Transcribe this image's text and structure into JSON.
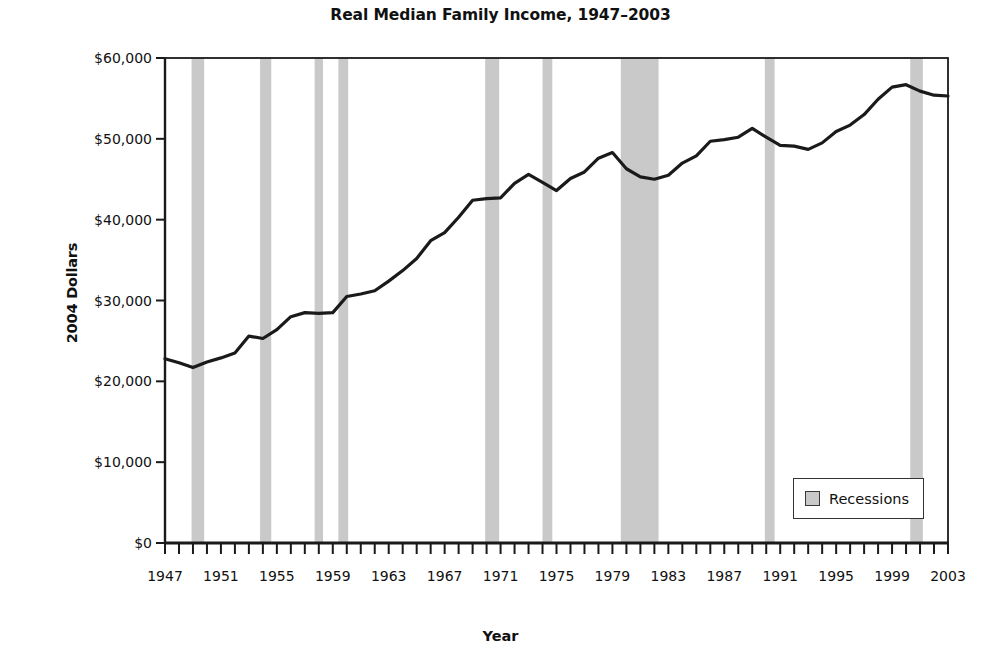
{
  "chart_data": {
    "type": "line",
    "title": "Real Median Family Income, 1947–2003",
    "xlabel": "Year",
    "ylabel": "2004 Dollars",
    "xlim": [
      1947,
      2003
    ],
    "ylim": [
      0,
      60000
    ],
    "grid": false,
    "legend": {
      "position": "bottom-right",
      "entries": [
        {
          "label": "Recessions",
          "swatch_color": "#c9c9c9",
          "type": "band"
        }
      ]
    },
    "ytick_values": [
      0,
      10000,
      20000,
      30000,
      40000,
      50000,
      60000
    ],
    "ytick_labels": [
      "$0",
      "$10,000",
      "$20,000",
      "$30,000",
      "$40,000",
      "$50,000",
      "$60,000"
    ],
    "xtick_values": [
      1947,
      1951,
      1955,
      1959,
      1963,
      1967,
      1971,
      1975,
      1979,
      1983,
      1987,
      1991,
      1995,
      1999,
      2003
    ],
    "xtick_labels": [
      "1947",
      "1951",
      "1955",
      "1959",
      "1963",
      "1967",
      "1971",
      "1975",
      "1979",
      "1983",
      "1987",
      "1991",
      "1995",
      "1999",
      "2003"
    ],
    "minor_xticks_every": 1,
    "series": [
      {
        "name": "Real Median Family Income",
        "color": "#1a1a1a",
        "line_width": 3.2,
        "x": [
          1947,
          1948,
          1949,
          1950,
          1951,
          1952,
          1953,
          1954,
          1955,
          1956,
          1957,
          1958,
          1959,
          1960,
          1961,
          1962,
          1963,
          1964,
          1965,
          1966,
          1967,
          1968,
          1969,
          1970,
          1971,
          1972,
          1973,
          1974,
          1975,
          1976,
          1977,
          1978,
          1979,
          1980,
          1981,
          1982,
          1983,
          1984,
          1985,
          1986,
          1987,
          1988,
          1989,
          1990,
          1991,
          1992,
          1993,
          1994,
          1995,
          1996,
          1997,
          1998,
          1999,
          2000,
          2001,
          2002,
          2003
        ],
        "y": [
          22800,
          22300,
          21700,
          22400,
          22900,
          23500,
          25600,
          25300,
          26400,
          28000,
          28500,
          28400,
          28500,
          30500,
          30800,
          31200,
          32400,
          33700,
          35200,
          37400,
          38400,
          40300,
          42400,
          42600,
          42700,
          44500,
          45600,
          44600,
          43600,
          45100,
          45900,
          47600,
          48300,
          46300,
          45300,
          45000,
          45500,
          47000,
          47900,
          49700,
          49900,
          50200,
          51300,
          50200,
          49200,
          49100,
          48700,
          49500,
          50900,
          51700,
          53000,
          54900,
          56400,
          56700,
          55900,
          55400,
          55300
        ]
      }
    ],
    "recession_bands": [
      {
        "start": 1948.9,
        "end": 1949.8,
        "label": "1948–49 recession"
      },
      {
        "start": 1953.8,
        "end": 1954.6,
        "label": "1953–54 recession"
      },
      {
        "start": 1957.7,
        "end": 1958.3,
        "label": "1957–58 recession"
      },
      {
        "start": 1959.4,
        "end": 1960.1,
        "label": "1960–61 recession"
      },
      {
        "start": 1969.9,
        "end": 1970.9,
        "label": "1969–70 recession"
      },
      {
        "start": 1974.0,
        "end": 1974.7,
        "label": "1973–75 recession"
      },
      {
        "start": 1979.6,
        "end": 1982.3,
        "label": "1980–82 recessions"
      },
      {
        "start": 1989.9,
        "end": 1990.6,
        "label": "1990–91 recession"
      },
      {
        "start": 2000.3,
        "end": 2001.2,
        "label": "2001 recession"
      }
    ],
    "band_color": "#c9c9c9"
  }
}
